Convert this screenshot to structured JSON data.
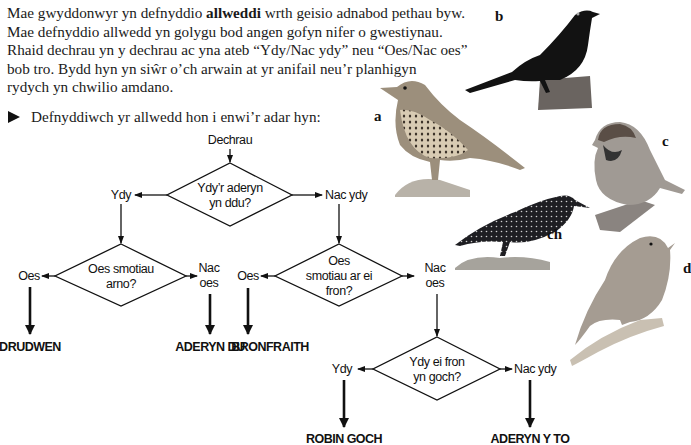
{
  "intro": {
    "line1_before": "Mae gwyddonwyr yn defnyddio ",
    "line1_bold": "allweddi",
    "line1_after": " wrth geisio adnabod pethau byw.",
    "line2": "Mae defnyddio allwedd yn golygu bod angen gofyn nifer o gwestiynau.",
    "line3": "Rhaid dechrau yn y dechrau ac yna ateb “Ydy/Nac ydy” neu “Oes/Nac oes”",
    "line4": "bob tro. Bydd hyn yn siŵr o’ch arwain at yr anifail neu’r planhigyn",
    "line5": "rydych yn chwilio amdano."
  },
  "instruction": {
    "icon": "play-bullet-icon",
    "text": "Defnyddiwch yr allwedd hon i enwi’r adar hyn:"
  },
  "key": {
    "start": "Dechrau",
    "q1": {
      "line1": "Ydy’r aderyn",
      "line2": "yn ddu?"
    },
    "q1_yes": "Ydy",
    "q1_no": "Nac ydy",
    "q2": {
      "line1": "Oes smotiau",
      "line2": "arno?"
    },
    "q2_yes": "Oes",
    "q2_no": {
      "line1": "Nac",
      "line2": "oes"
    },
    "q3": {
      "line1": "Oes",
      "line2": "smotiau ar ei",
      "line3": "fron?"
    },
    "q3_yes": "Oes",
    "q3_no": {
      "line1": "Nac",
      "line2": "oes"
    },
    "q4": {
      "line1": "Ydy ei fron",
      "line2": "yn goch?"
    },
    "q4_yes": "Ydy",
    "q4_no": "Nac ydy",
    "results": {
      "starling": "DRUDWEN",
      "blackbird": "ADERYN DU",
      "thrush": "BRONFRAITH",
      "robin": "ROBIN GOCH",
      "sparrow": "ADERYN Y TO"
    }
  },
  "birds": [
    {
      "label": "a",
      "depicts": "song-thrush"
    },
    {
      "label": "b",
      "depicts": "blackbird"
    },
    {
      "label": "c",
      "depicts": "house-sparrow"
    },
    {
      "label": "ch",
      "depicts": "starling"
    },
    {
      "label": "d",
      "depicts": "robin"
    }
  ]
}
